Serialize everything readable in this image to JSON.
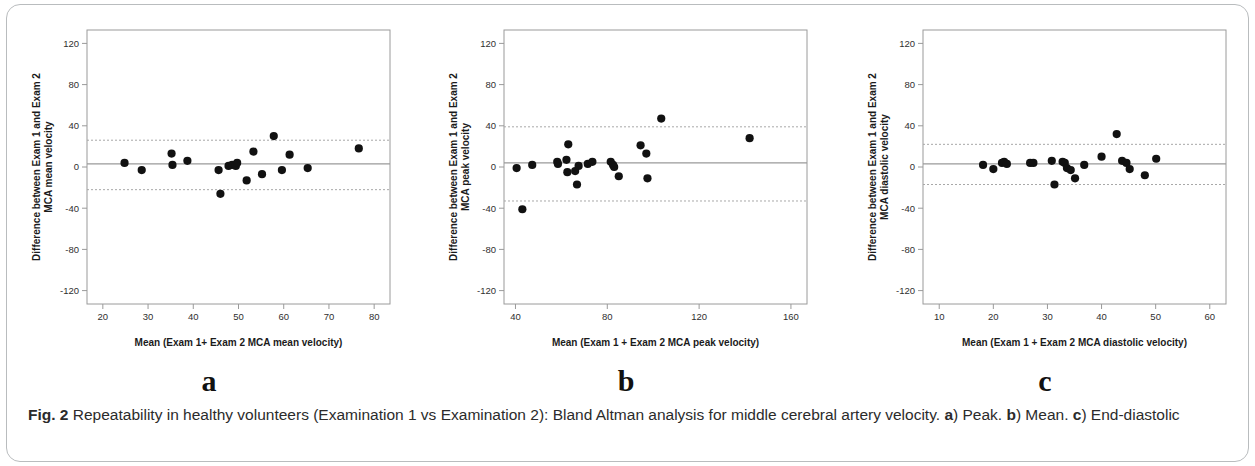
{
  "figure": {
    "caption_label": "Fig. 2",
    "caption_text_1": " Repeatability in healthy volunteers (Examination 1 vs Examination 2): Bland Altman analysis for middle cerebral artery velocity. ",
    "caption_a": "a",
    "caption_text_2": ") Peak. ",
    "caption_b": "b",
    "caption_text_3": ") Mean. ",
    "caption_c": "c",
    "caption_text_4": ") End-diastolic"
  },
  "colors": {
    "point": "#111111",
    "frame": "#9a9a9a",
    "bias_line": "#9a9a9a",
    "loa_line": "#a8a8a8",
    "text": "#2f2f2f",
    "card_border": "#b9bcbe"
  },
  "panels": [
    {
      "letter": "a",
      "ylabel_line1": "Difference between Exam 1 and Exam 2",
      "ylabel_line2": "MCA mean velocity",
      "xlabel": "Mean (Exam 1+ Exam 2 MCA mean velocity)",
      "yticks": [
        "120",
        "80",
        "40",
        "0",
        "-40",
        "-80",
        "-120"
      ],
      "xticks": [
        "20",
        "30",
        "40",
        "50",
        "60",
        "70",
        "80"
      ]
    },
    {
      "letter": "b",
      "ylabel_line1": "Difference between Exam 1 and Exam 2",
      "ylabel_line2": "MCA peak velocity",
      "xlabel": "Mean (Exam 1 + Exam 2 MCA peak velocity)",
      "yticks": [
        "120",
        "80",
        "40",
        "0",
        "-40",
        "-80",
        "-120"
      ],
      "xticks": [
        "40",
        "80",
        "120",
        "160"
      ]
    },
    {
      "letter": "c",
      "ylabel_line1": "Difference between Exam 1 and Exam 2",
      "ylabel_line2": "MCA diastolic velocity",
      "xlabel": "Mean (Exam 1 + Exam 2 MCA diastolic velocity)",
      "yticks": [
        "120",
        "80",
        "40",
        "0",
        "-40",
        "-80",
        "-120"
      ],
      "xticks": [
        "10",
        "20",
        "30",
        "40",
        "50",
        "60"
      ]
    }
  ],
  "chart_data": [
    {
      "type": "scatter",
      "panel": "a",
      "title": "",
      "xlabel": "Mean (Exam 1+ Exam 2 MCA mean velocity)",
      "ylabel": "Difference between Exam 1 and Exam 2 MCA mean velocity",
      "xlim": [
        16.5,
        83.5
      ],
      "ylim": [
        -133,
        133
      ],
      "xticks": [
        20,
        30,
        40,
        50,
        60,
        70,
        80
      ],
      "yticks": [
        120,
        80,
        40,
        0,
        -40,
        -80,
        -120
      ],
      "grid": false,
      "bias": 3,
      "loa_upper": 26,
      "loa_lower": -22,
      "x": [
        24.8,
        28.6,
        35.2,
        35.4,
        38.7,
        45.6,
        47.8,
        48.6,
        49.4,
        49.7,
        51.8,
        53.3,
        55.2,
        57.8,
        59.6,
        61.3,
        65.3,
        76.6,
        46.0
      ],
      "y": [
        4,
        -3,
        13,
        2,
        6,
        -3,
        1,
        2,
        1,
        4,
        -13,
        15,
        -7,
        30,
        -3,
        12,
        -1,
        18,
        -26
      ]
    },
    {
      "type": "scatter",
      "panel": "b",
      "title": "",
      "xlabel": "Mean (Exam 1 + Exam 2 MCA peak velocity)",
      "ylabel": "Difference between Exam 1 and Exam 2 MCA peak velocity",
      "xlim": [
        35,
        167
      ],
      "ylim": [
        -133,
        133
      ],
      "xticks": [
        40,
        80,
        120,
        160
      ],
      "yticks": [
        120,
        80,
        40,
        0,
        -40,
        -80,
        -120
      ],
      "grid": false,
      "bias": 4,
      "loa_upper": 39,
      "loa_lower": -33,
      "x": [
        40.5,
        43.0,
        47.3,
        58.2,
        58.5,
        62.2,
        62.6,
        63.0,
        66.0,
        66.8,
        67.5,
        71.5,
        73.5,
        81.5,
        82.5,
        83.0,
        85.0,
        94.5,
        97.0,
        97.5,
        103.5,
        142.0
      ],
      "y": [
        -1,
        -41,
        2,
        5,
        3,
        7,
        -5,
        22,
        -4,
        -17,
        1,
        3,
        5,
        5,
        2,
        0,
        -9,
        21,
        13,
        -11,
        47,
        28
      ]
    },
    {
      "type": "scatter",
      "panel": "c",
      "title": "",
      "xlabel": "Mean (Exam 1 + Exam 2 MCA diastolic velocity)",
      "ylabel": "Difference between Exam 1 and Exam 2 MCA diastolic velocity",
      "xlim": [
        7,
        63
      ],
      "ylim": [
        -133,
        133
      ],
      "xticks": [
        10,
        20,
        30,
        40,
        50,
        60
      ],
      "yticks": [
        120,
        80,
        40,
        0,
        -40,
        -80,
        -120
      ],
      "grid": false,
      "bias": 3,
      "loa_upper": 22,
      "loa_lower": -17,
      "x": [
        18.1,
        20.0,
        21.6,
        22.0,
        22.5,
        26.8,
        27.4,
        30.8,
        31.3,
        32.8,
        33.2,
        33.6,
        34.3,
        35.1,
        36.8,
        40.0,
        42.8,
        43.8,
        44.6,
        45.2,
        48.0,
        50.1
      ],
      "y": [
        2,
        -2,
        4,
        5,
        3,
        4,
        4,
        6,
        -17,
        5,
        4,
        -1,
        -3,
        -11,
        2,
        10,
        32,
        6,
        4,
        -2,
        -8,
        8
      ]
    }
  ]
}
